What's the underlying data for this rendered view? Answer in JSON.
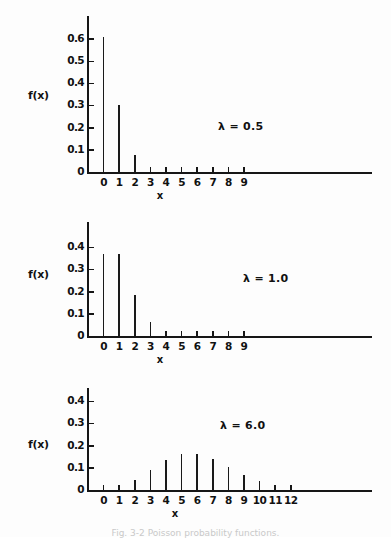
{
  "figure": {
    "background": "#fdfdfd",
    "ink_color": "#161616",
    "caption": "Fig. 3-2  Poisson probability functions."
  },
  "panels": [
    {
      "id": "poisson-lambda-0-5",
      "ylabel": "f(x)",
      "xlabel": "x",
      "annotation": "λ = 0.5",
      "yticks": [
        "0",
        "0.1",
        "0.2",
        "0.3",
        "0.4",
        "0.5",
        "0.6"
      ],
      "xticks": [
        "0",
        "1",
        "2",
        "3",
        "4",
        "5",
        "6",
        "7",
        "8",
        "9"
      ]
    },
    {
      "id": "poisson-lambda-1-0",
      "ylabel": "f(x)",
      "xlabel": "x",
      "annotation": "λ = 1.0",
      "yticks": [
        "0",
        "0.1",
        "0.2",
        "0.3",
        "0.4"
      ],
      "xticks": [
        "0",
        "1",
        "2",
        "3",
        "4",
        "5",
        "6",
        "7",
        "8",
        "9"
      ]
    },
    {
      "id": "poisson-lambda-6-0",
      "ylabel": "f(x)",
      "xlabel": "x",
      "annotation": "λ = 6.0",
      "yticks": [
        "0",
        "0.1",
        "0.2",
        "0.3",
        "0.4"
      ],
      "xticks": [
        "0",
        "1",
        "2",
        "3",
        "4",
        "5",
        "6",
        "7",
        "8",
        "9",
        "10",
        "11",
        "12"
      ]
    }
  ],
  "chart_data": [
    {
      "type": "bar",
      "title": "",
      "subtitle": "λ = 0.5",
      "xlabel": "x",
      "ylabel": "f(x)",
      "categories": [
        0,
        1,
        2,
        3,
        4,
        5,
        6,
        7,
        8,
        9
      ],
      "values": [
        0.607,
        0.303,
        0.076,
        0.013,
        0.002,
        0.0,
        0.0,
        0.0,
        0.0,
        0.0
      ],
      "ylim": [
        0,
        0.7
      ],
      "yticks": [
        0,
        0.1,
        0.2,
        0.3,
        0.4,
        0.5,
        0.6
      ],
      "xlim": [
        0,
        9
      ],
      "grid": false,
      "legend": false,
      "annotations": [
        "λ = 0.5"
      ]
    },
    {
      "type": "bar",
      "title": "",
      "subtitle": "λ = 1.0",
      "xlabel": "x",
      "ylabel": "f(x)",
      "categories": [
        0,
        1,
        2,
        3,
        4,
        5,
        6,
        7,
        8,
        9
      ],
      "values": [
        0.368,
        0.368,
        0.184,
        0.061,
        0.015,
        0.003,
        0.001,
        0.0,
        0.0,
        0.0
      ],
      "ylim": [
        0,
        0.46
      ],
      "yticks": [
        0,
        0.1,
        0.2,
        0.3,
        0.4
      ],
      "xlim": [
        0,
        9
      ],
      "grid": false,
      "legend": false,
      "annotations": [
        "λ = 1.0"
      ]
    },
    {
      "type": "bar",
      "title": "",
      "subtitle": "λ = 6.0",
      "xlabel": "x",
      "ylabel": "f(x)",
      "categories": [
        0,
        1,
        2,
        3,
        4,
        5,
        6,
        7,
        8,
        9,
        10,
        11,
        12
      ],
      "values": [
        0.002,
        0.015,
        0.045,
        0.089,
        0.134,
        0.161,
        0.161,
        0.138,
        0.103,
        0.069,
        0.041,
        0.023,
        0.011
      ],
      "ylim": [
        0,
        0.46
      ],
      "yticks": [
        0,
        0.1,
        0.2,
        0.3,
        0.4
      ],
      "xlim": [
        0,
        12
      ],
      "grid": false,
      "legend": false,
      "annotations": [
        "λ = 6.0"
      ]
    }
  ]
}
